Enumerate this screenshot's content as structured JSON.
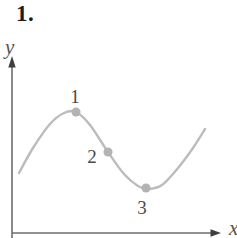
{
  "figure": {
    "problem_number": "1.",
    "y_axis_label": "y",
    "x_axis_label": "x"
  },
  "colors": {
    "background": "#ffffff",
    "curve": "#bcbcbc",
    "point_dot": "#b3b3b3",
    "axis": "#6e6e6e",
    "arrowhead": "#3f3f3f",
    "point_label_text": "#4a4a4a",
    "axis_label_text": "#555555",
    "problem_number_text": "#1c1c1c"
  },
  "chart_data": {
    "type": "line",
    "title": "",
    "xlabel": "x",
    "ylabel": "y",
    "axis_ticks": "none (qualitative sketch, no numeric scale)",
    "grid": false,
    "legend": false,
    "coordinate_note": "pixel coordinates, y increases downward, canvas 237x238",
    "curve_points_px": [
      [
        19,
        173
      ],
      [
        33,
        148
      ],
      [
        50,
        124
      ],
      [
        64,
        113
      ],
      [
        76,
        112
      ],
      [
        90,
        125
      ],
      [
        108,
        152
      ],
      [
        124,
        174
      ],
      [
        138,
        186
      ],
      [
        148,
        189
      ],
      [
        162,
        185
      ],
      [
        178,
        168
      ],
      [
        193,
        148
      ],
      [
        205,
        129
      ]
    ],
    "marked_points": [
      {
        "label": "1",
        "dot_px": [
          76,
          112
        ],
        "label_px": [
          75,
          103
        ],
        "feature": "local maximum"
      },
      {
        "label": "2",
        "dot_px": [
          108,
          152
        ],
        "label_px": [
          92,
          163
        ],
        "feature": "inflection point on descent"
      },
      {
        "label": "3",
        "dot_px": [
          146,
          188
        ],
        "label_px": [
          142,
          214
        ],
        "feature": "local minimum"
      }
    ]
  }
}
